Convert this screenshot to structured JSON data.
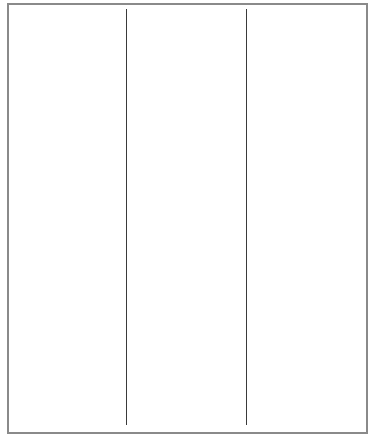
{
  "layout": {
    "type": "three-column-empty-frame",
    "column_count": 3,
    "columns": [
      {
        "index": 0,
        "content": ""
      },
      {
        "index": 1,
        "content": ""
      },
      {
        "index": 2,
        "content": ""
      }
    ]
  },
  "colors": {
    "background": "#ffffff",
    "frame_border": "#8a8a8a",
    "divider": "#3a3a3a"
  }
}
